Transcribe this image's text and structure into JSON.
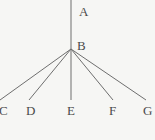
{
  "figure": {
    "background_color": "#f6f6f4",
    "edge_color": "#6e6e6e",
    "label_color": "#4a4a4a"
  },
  "nodes": {
    "a": {
      "label": "A",
      "x": 79,
      "y": 5
    },
    "b": {
      "label": "B",
      "x": 77,
      "y": 39
    },
    "c": {
      "label": "C",
      "x": -1,
      "y": 104
    },
    "d": {
      "label": "D",
      "x": 26,
      "y": 104
    },
    "e": {
      "label": "E",
      "x": 67,
      "y": 104
    },
    "f": {
      "label": "F",
      "x": 109,
      "y": 104
    },
    "g": {
      "label": "G",
      "x": 143,
      "y": 104
    }
  },
  "chart_data": {
    "type": "diagram",
    "title": "",
    "diagram_kind": "node-link tree",
    "root": "A",
    "junction": "B",
    "leaves": [
      "C",
      "D",
      "E",
      "F",
      "G"
    ],
    "vertices": [
      {
        "id": "A",
        "label": "A",
        "px": [
          71,
          0
        ]
      },
      {
        "id": "B",
        "label": "B",
        "px": [
          71,
          49
        ]
      },
      {
        "id": "C",
        "label": "C",
        "px": [
          0,
          100
        ]
      },
      {
        "id": "D",
        "label": "D",
        "px": [
          29,
          100
        ]
      },
      {
        "id": "E",
        "label": "E",
        "px": [
          71,
          100
        ]
      },
      {
        "id": "F",
        "label": "F",
        "px": [
          113,
          100
        ]
      },
      {
        "id": "G",
        "label": "G",
        "px": [
          146,
          100
        ]
      }
    ],
    "edges": [
      {
        "from": "A",
        "to": "B",
        "x1": 71,
        "y1": 0,
        "x2": 71,
        "y2": 49
      },
      {
        "from": "B",
        "to": "C",
        "x1": 71,
        "y1": 49,
        "x2": 0,
        "y2": 100
      },
      {
        "from": "B",
        "to": "D",
        "x1": 71,
        "y1": 49,
        "x2": 29,
        "y2": 100
      },
      {
        "from": "B",
        "to": "E",
        "x1": 71,
        "y1": 49,
        "x2": 71,
        "y2": 100
      },
      {
        "from": "B",
        "to": "F",
        "x1": 71,
        "y1": 49,
        "x2": 113,
        "y2": 100
      },
      {
        "from": "B",
        "to": "G",
        "x1": 71,
        "y1": 49,
        "x2": 146,
        "y2": 100
      }
    ],
    "edge_count": 6,
    "node_count": 7,
    "grid": false,
    "legend": false
  }
}
